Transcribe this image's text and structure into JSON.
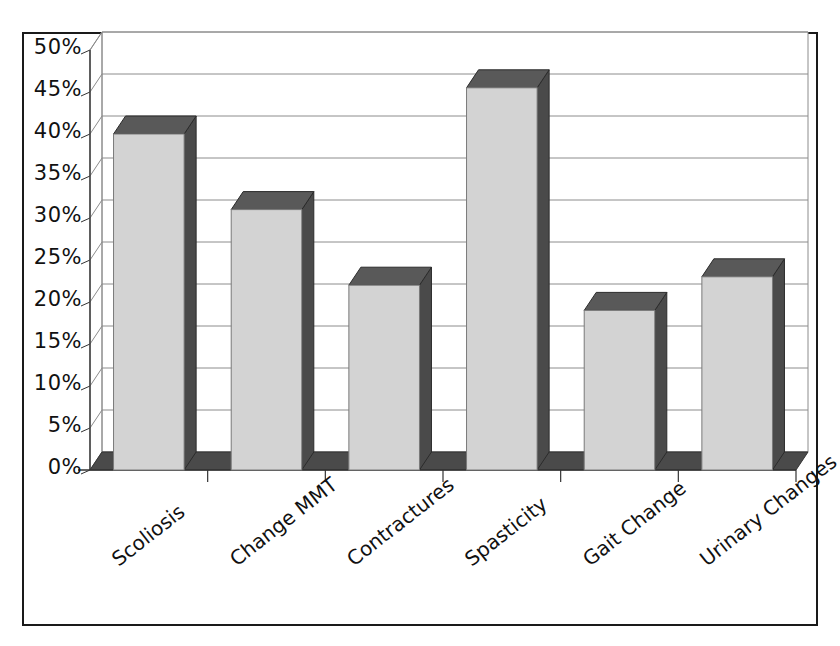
{
  "chart_data": {
    "type": "bar",
    "title": "",
    "subtitle": "",
    "xlabel": "",
    "ylabel": "",
    "categories": [
      "Scoliosis",
      "Change MMT",
      "Contractures",
      "Spasticity",
      "Gait Change",
      "Urinary Changes"
    ],
    "values": [
      40,
      31,
      22,
      45.5,
      19,
      23
    ],
    "ylim": [
      0,
      50
    ],
    "ytick_labels": [
      "0%",
      "5%",
      "10%",
      "15%",
      "20%",
      "25%",
      "30%",
      "35%",
      "40%",
      "45%",
      "50%"
    ],
    "ytick_values": [
      0,
      5,
      10,
      15,
      20,
      25,
      30,
      35,
      40,
      45,
      50
    ],
    "grid": true,
    "legend": false,
    "legend_position": "none",
    "style": "3d-column",
    "colors": {
      "bar_front": "#d3d3d3",
      "bar_side": "#4a4a4a",
      "bar_top": "#595959",
      "floor": "#4a4a4a",
      "gridline": "#8c8c8c",
      "axis": "#333333",
      "frame": "#1a1a1a",
      "background": "#ffffff",
      "text": "#111111"
    }
  }
}
